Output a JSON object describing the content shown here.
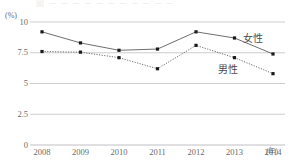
{
  "chart_data": {
    "type": "line",
    "title": "",
    "xlabel": "(年)",
    "ylabel": "(%)",
    "categories": [
      "2008",
      "2009",
      "2010",
      "2011",
      "2012",
      "2013",
      "2014"
    ],
    "ylim": [
      0,
      10
    ],
    "yticks": [
      "0",
      "2.5",
      "5",
      "7.5",
      "10"
    ],
    "grid": true,
    "legend_position": "inline-right",
    "series": [
      {
        "name": "女性",
        "style": "solid",
        "marker": "square",
        "values": [
          9.2,
          8.3,
          7.7,
          7.8,
          9.2,
          8.7,
          7.4
        ]
      },
      {
        "name": "男性",
        "style": "dotted",
        "marker": "square",
        "values": [
          7.6,
          7.55,
          7.1,
          6.2,
          8.1,
          7.1,
          5.8
        ]
      }
    ]
  },
  "axes": {
    "unit_label": "(%)",
    "x_unit_label": "(年)",
    "y_tick_labels": [
      "10",
      "7.5",
      "5",
      "2.5",
      "0"
    ],
    "x_tick_labels": [
      "2008",
      "2009",
      "2010",
      "2011",
      "2012",
      "2013",
      "2014"
    ]
  },
  "legend": {
    "female_label": "女性",
    "male_label": "男性"
  },
  "title_remnant": "図 ─ ─ ─ ─ ─ ─ ─ ─ ─ ─ ─",
  "colors": {
    "grid": "#b9b9bd",
    "series_line": "#4a4a4a",
    "marker": "#1a1a1a",
    "text": "#6a6a6a"
  }
}
